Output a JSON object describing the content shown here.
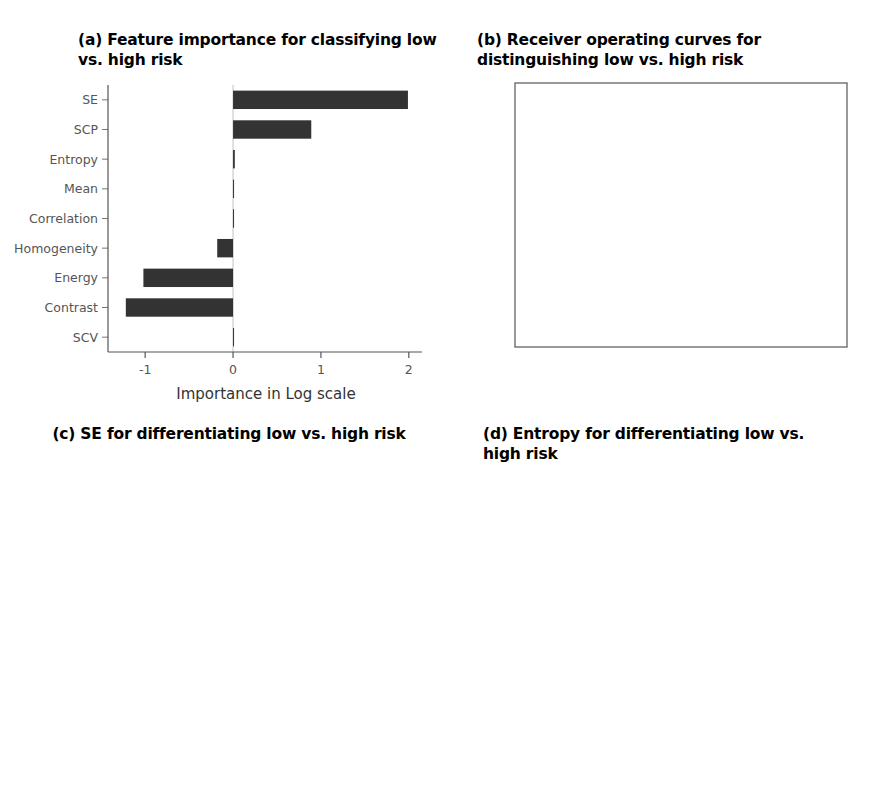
{
  "figure": {
    "panels": [
      "a",
      "b",
      "c",
      "d"
    ]
  },
  "panel_a": {
    "title": "(a) Feature importance for classifying low vs. high risk",
    "xlabel": "Importance in Log scale",
    "bar_color": "#333333"
  },
  "panel_b": {
    "title": "(b) Receiver operating curves for distinguishing low vs. high risk",
    "xlabel": "Specificity",
    "ylabel": "Sensitivity",
    "legend": [
      "Textures & Inter-Site",
      "Textures only"
    ],
    "line_color": "#555555"
  },
  "panel_c": {
    "title": "(c) SE for differentiating low vs. high risk",
    "legend_title": "outcome",
    "legend": [
      "High risk",
      "Low risk"
    ],
    "ylabel": "SE",
    "xlabel": "outcome",
    "pvalue": "P = 0.048",
    "groups": [
      "High risk",
      "Low risk"
    ],
    "high_color": "#636363",
    "low_color": "#bdbdbd"
  },
  "panel_d": {
    "title": "(d) Entropy for differentiating low vs. high risk",
    "legend_title": "outcome",
    "legend": [
      "High risk",
      "Low risk"
    ],
    "ylabel": "entropy",
    "xlabel": "outcome",
    "pvalue": "P = 0.99",
    "groups": [
      "High risk",
      "Low risk"
    ],
    "high_color": "#636363",
    "low_color": "#bdbdbd"
  },
  "chart_data": [
    {
      "panel": "a",
      "type": "bar",
      "orientation": "horizontal",
      "title": "(a) Feature importance for classifying low vs. high risk",
      "xlabel": "Importance in Log scale",
      "ylabel": "",
      "categories": [
        "SE",
        "SCP",
        "Entropy",
        "Mean",
        "Correlation",
        "Homogeneity",
        "Energy",
        "Contrast",
        "SCV"
      ],
      "values": [
        1.99,
        0.89,
        0.02,
        0.0,
        0.01,
        -0.18,
        -1.02,
        -1.22,
        0.0
      ],
      "xlim": [
        -1.4,
        2.15
      ],
      "xticks": [
        -1,
        0,
        1,
        2
      ],
      "grid": false
    },
    {
      "panel": "b",
      "type": "line",
      "title": "(b) Receiver operating curves for distinguishing low vs. high risk",
      "xlabel": "Specificity",
      "ylabel": "Sensitivity",
      "xlim": [
        1.0,
        0.0
      ],
      "ylim": [
        0.0,
        1.0
      ],
      "xticks": [
        1.0,
        0.8,
        0.6,
        0.4,
        0.2,
        0.0
      ],
      "yticks": [
        0.0,
        0.2,
        0.4,
        0.6,
        0.8,
        1.0
      ],
      "x_reversed": true,
      "legend_position": "bottom-right",
      "series": [
        {
          "name": "Textures & Inter-Site",
          "x": [
            1.0,
            0.995,
            0.99,
            0.98,
            0.96,
            0.94,
            0.9,
            0.85,
            0.8,
            0.7,
            0.6,
            0.5,
            0.4,
            0.3,
            0.2,
            0.1,
            0.05,
            0.0
          ],
          "y": [
            0.0,
            0.3,
            0.44,
            0.55,
            0.63,
            0.67,
            0.715,
            0.745,
            0.775,
            0.825,
            0.865,
            0.9,
            0.925,
            0.945,
            0.965,
            0.985,
            0.993,
            1.0
          ]
        },
        {
          "name": "Textures only",
          "x": [
            1.0,
            0.995,
            0.99,
            0.98,
            0.95,
            0.9,
            0.85,
            0.8,
            0.7,
            0.6,
            0.5,
            0.4,
            0.3,
            0.2,
            0.12,
            0.05,
            0.0
          ],
          "y": [
            0.0,
            0.055,
            0.09,
            0.135,
            0.215,
            0.3,
            0.355,
            0.41,
            0.505,
            0.59,
            0.665,
            0.735,
            0.8,
            0.875,
            0.925,
            0.975,
            1.0
          ]
        }
      ]
    },
    {
      "panel": "c",
      "type": "boxplot",
      "title": "(c) SE for differentiating low vs. high risk",
      "xlabel": "outcome",
      "ylabel": "SE",
      "ylim": [
        0,
        5.45
      ],
      "yticks": [
        0,
        1,
        2,
        3,
        4,
        5
      ],
      "annotation": "P = 0.048",
      "boxes": [
        {
          "group": "High risk",
          "lower_whisker": 2.75,
          "q1": 3.45,
          "median": 4.0,
          "q3": 4.35,
          "upper_whisker": 5.15,
          "outliers": [
            1.55
          ]
        },
        {
          "group": "Low risk",
          "lower_whisker": 3.9,
          "q1": 4.1,
          "median": 4.33,
          "q3": 4.7,
          "upper_whisker": 4.95,
          "outliers": []
        }
      ]
    },
    {
      "panel": "d",
      "type": "boxplot",
      "title": "(d) Entropy for differentiating low vs. high risk",
      "xlabel": "outcome",
      "ylabel": "entropy",
      "ylim": [
        0,
        280
      ],
      "yticks": [
        0,
        100,
        200
      ],
      "annotation": "P = 0.99",
      "boxes": [
        {
          "group": "High risk",
          "lower_whisker": 42,
          "q1": 175,
          "median": 222,
          "q3": 265,
          "upper_whisker": 265,
          "outliers": [
            18
          ]
        },
        {
          "group": "Low risk",
          "lower_whisker": 78,
          "q1": 100,
          "median": 228,
          "q3": 258,
          "upper_whisker": 258,
          "outliers": []
        }
      ]
    }
  ]
}
